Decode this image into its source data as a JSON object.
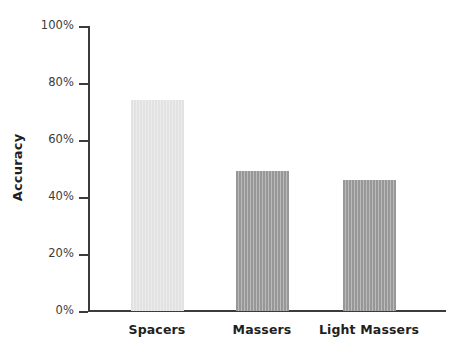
{
  "chart_data": {
    "type": "bar",
    "title": "",
    "subtitle": "",
    "xlabel": "",
    "ylabel": "Accuracy",
    "categories": [
      "Spacers",
      "Massers",
      "Light Massers"
    ],
    "values": [
      74,
      49,
      46
    ],
    "value_unit": "%",
    "ylim": [
      0,
      100
    ],
    "ytick_values": [
      0,
      20,
      40,
      60,
      80,
      100
    ],
    "ytick_labels": [
      "0%",
      "20%",
      "40%",
      "60%",
      "80%",
      "100%"
    ],
    "grid": false,
    "legend": null,
    "legend_position": "none",
    "annotations": [],
    "series": [
      {
        "name": "Accuracy",
        "values": [
          74,
          49,
          46
        ],
        "colors": [
          "#e2e2e2",
          "#979797",
          "#979797"
        ]
      }
    ],
    "colors": {
      "bar_light": "#e2e2e2",
      "bar_dark": "#979797",
      "axis": "#3b3b3b",
      "text": "#1f1f1f",
      "tick_text": "#3b3b3b",
      "background": "#ffffff"
    }
  }
}
